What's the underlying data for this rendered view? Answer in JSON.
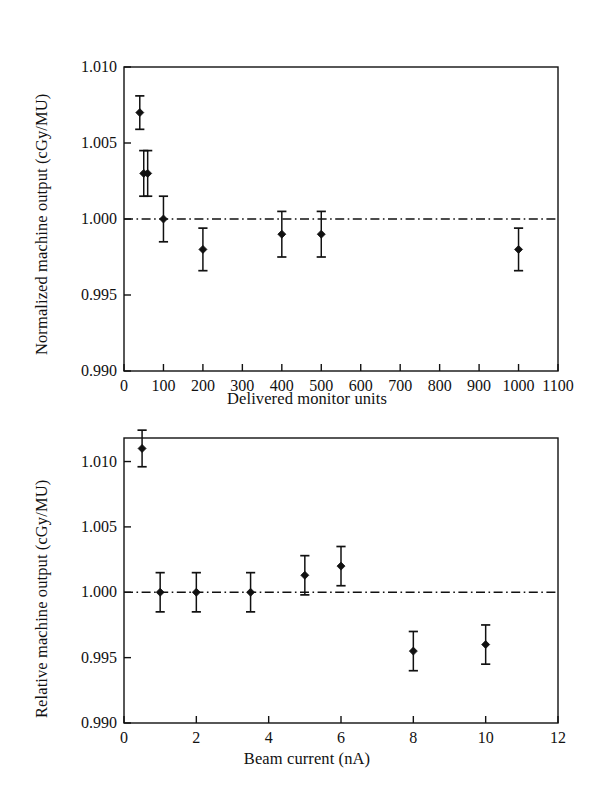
{
  "figure": {
    "background": "#ffffff",
    "ink": "#111111",
    "panels": [
      "top",
      "bottom"
    ]
  },
  "chart_data": [
    {
      "id": "top",
      "type": "scatter",
      "title": "",
      "xlabel": "Delivered monitor units",
      "ylabel": "Normalized machine output (cGy/MU)",
      "xlim": [
        0,
        1100
      ],
      "ylim": [
        0.99,
        1.01
      ],
      "xticks": [
        0,
        100,
        200,
        300,
        400,
        500,
        600,
        700,
        800,
        900,
        1000,
        1100
      ],
      "xticklabels": [
        "0",
        "100",
        "200",
        "300",
        "400",
        "500",
        "600",
        "700",
        "800",
        "900",
        "1000",
        "1100"
      ],
      "yticks": [
        0.99,
        0.995,
        1.0,
        1.005,
        1.01
      ],
      "yticklabels": [
        "0.990",
        "0.995",
        "1.000",
        "1.005",
        "1.010"
      ],
      "grid": false,
      "legend": null,
      "reference_line": {
        "y": 1.0,
        "style": "dash-dot",
        "label": "unity"
      },
      "marker": "filled-diamond",
      "errorbars": true,
      "x": [
        40,
        50,
        60,
        100,
        200,
        400,
        500,
        1000
      ],
      "y": [
        1.007,
        1.003,
        1.003,
        1.0,
        0.998,
        0.999,
        0.999,
        0.998
      ],
      "yerr": [
        0.0011,
        0.0015,
        0.0015,
        0.0015,
        0.0014,
        0.0015,
        0.0015,
        0.0014
      ]
    },
    {
      "id": "bottom",
      "type": "scatter",
      "title": "",
      "xlabel": "Beam current (nA)",
      "ylabel": "Relative machine output (cGy/MU)",
      "xlim": [
        0,
        12
      ],
      "ylim": [
        0.99,
        1.0118
      ],
      "xticks": [
        0,
        2,
        4,
        6,
        8,
        10,
        12
      ],
      "xticklabels": [
        "0",
        "2",
        "4",
        "6",
        "8",
        "10",
        "12"
      ],
      "yticks": [
        0.99,
        0.995,
        1.0,
        1.005,
        1.01
      ],
      "yticklabels": [
        "0.990",
        "0.995",
        "1.000",
        "1.005",
        "1.010"
      ],
      "grid": false,
      "legend": null,
      "reference_line": {
        "y": 1.0,
        "style": "dash-dot",
        "label": "unity"
      },
      "marker": "filled-diamond",
      "errorbars": true,
      "x": [
        0.5,
        1.0,
        2.0,
        3.5,
        5.0,
        6.0,
        8.0,
        10.0
      ],
      "y": [
        1.011,
        1.0,
        1.0,
        1.0,
        1.0013,
        1.002,
        0.9955,
        0.996
      ],
      "yerr": [
        0.0014,
        0.0015,
        0.0015,
        0.0015,
        0.0015,
        0.0015,
        0.0015,
        0.0015
      ]
    }
  ]
}
